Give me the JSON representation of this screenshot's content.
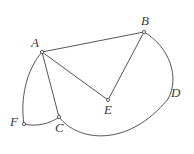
{
  "figure": {
    "name": "geometric-figure-abcdef",
    "width": 194,
    "height": 154,
    "background_color": "#ffffff",
    "stroke_color": "#555555",
    "label_color": "#3b3b3b",
    "stroke_width": 1
  },
  "vertices": [
    {
      "id": "A",
      "label": "A",
      "x": 42,
      "y": 52,
      "label_x": 31,
      "label_y": 36,
      "marker": true
    },
    {
      "id": "B",
      "label": "B",
      "x": 144,
      "y": 32,
      "label_x": 141,
      "label_y": 14,
      "marker": true
    },
    {
      "id": "C",
      "label": "C",
      "x": 59,
      "y": 117,
      "label_x": 55,
      "label_y": 121,
      "marker": true
    },
    {
      "id": "D",
      "label": "D",
      "x": 168,
      "y": 99,
      "label_x": 171,
      "label_y": 86,
      "marker": false
    },
    {
      "id": "E",
      "label": "E",
      "x": 108,
      "y": 100,
      "label_x": 104,
      "label_y": 103,
      "marker": true
    },
    {
      "id": "F",
      "label": "F",
      "x": 24,
      "y": 124,
      "label_x": 10,
      "label_y": 115,
      "marker": true
    }
  ],
  "segments": [
    {
      "name": "segment-ab",
      "from": "A",
      "to": "B",
      "path": "M 42 52 L 144 32"
    },
    {
      "name": "segment-ae",
      "from": "A",
      "to": "E",
      "path": "M 42 52 L 108 100"
    },
    {
      "name": "segment-ac",
      "from": "A",
      "to": "C",
      "path": "M 42 52 L 59 117"
    },
    {
      "name": "segment-be",
      "from": "B",
      "to": "E",
      "path": "M 144 32 L 108 100"
    }
  ],
  "arcs": [
    {
      "name": "arc-af",
      "from": "A",
      "to": "F",
      "path": "M 42 52 C 26 70 20 100 24 124"
    },
    {
      "name": "arc-fc",
      "from": "F",
      "to": "C",
      "path": "M 24 124 C 36 127 50 124 59 117"
    },
    {
      "name": "arc-cd",
      "from": "C",
      "to": "D",
      "path": "M 59 117 C 78 142 128 148 168 99"
    },
    {
      "name": "arc-db",
      "from": "D",
      "to": "B",
      "path": "M 168 99 C 180 78 170 47 144 32"
    }
  ],
  "caption": {
    "alt": "Plane figure with points A, B, C, D, E, F joined by straight segments AB, AE, AC, BE and curved arcs AF, FC, CD, DB"
  }
}
